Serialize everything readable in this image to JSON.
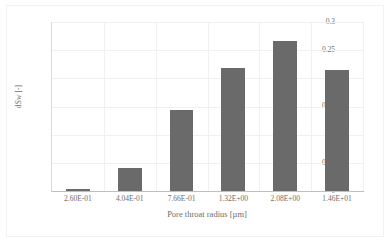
{
  "chart_data": {
    "type": "bar",
    "title": "",
    "xlabel": "Pore throat radius [µm]",
    "ylabel": "dSw [-]",
    "categories": [
      "2.60E-01",
      "4.04E-01",
      "7.66E-01",
      "1.32E+00",
      "2.08E+00",
      "1.46E+01"
    ],
    "values": [
      0.004,
      0.04,
      0.143,
      0.219,
      0.266,
      0.215
    ],
    "ylim": [
      0,
      0.3
    ],
    "yticks": [
      "0",
      "0.05",
      "0.1",
      "0.15",
      "0.2",
      "0.25",
      "0.3"
    ],
    "ytick_values": [
      0,
      0.05,
      0.1,
      0.15,
      0.2,
      0.25,
      0.3
    ],
    "grid": true,
    "grid_axis": "both",
    "legend": false,
    "legend_position": "none",
    "series": [
      {
        "name": "dSw",
        "values": [
          0.004,
          0.04,
          0.143,
          0.219,
          0.266,
          0.215
        ]
      }
    ]
  },
  "style": {
    "bar_color": "#6a6a6a",
    "grid_color": "#f0f0f0",
    "axis_color": "#bfbfbf",
    "text_color": "#6d6d6d",
    "background": "#ffffff",
    "frame_border": "#f2f2f2"
  }
}
